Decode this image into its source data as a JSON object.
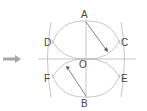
{
  "diagram": {
    "type": "geometric-construction",
    "arrow_indicator": {
      "direction": "right",
      "color": "#9a9a9a"
    },
    "colors": {
      "line": "#b0b0b0",
      "text": "#444444",
      "arrow": "#555555"
    },
    "center": {
      "label": "O",
      "x": 86,
      "y": 59
    },
    "main_circle": {
      "cx": 86,
      "cy": 59,
      "r": 38
    },
    "points": [
      {
        "label": "A",
        "x": 86,
        "y": 21,
        "lx": 82,
        "ly": 17
      },
      {
        "label": "B",
        "x": 86,
        "y": 97,
        "lx": 82,
        "ly": 107
      },
      {
        "label": "C",
        "x": 117,
        "y": 41,
        "lx": 122,
        "ly": 45
      },
      {
        "label": "D",
        "x": 55,
        "y": 41,
        "lx": 44,
        "ly": 45
      },
      {
        "label": "E",
        "x": 117,
        "y": 77,
        "lx": 122,
        "ly": 81
      },
      {
        "label": "F",
        "x": 55,
        "y": 77,
        "lx": 44,
        "ly": 81
      },
      {
        "label": "O",
        "x": 86,
        "y": 59,
        "lx": 80,
        "ly": 69
      }
    ],
    "labels": {
      "A": "A",
      "B": "B",
      "C": "C",
      "D": "D",
      "E": "E",
      "F": "F",
      "O": "O"
    }
  }
}
